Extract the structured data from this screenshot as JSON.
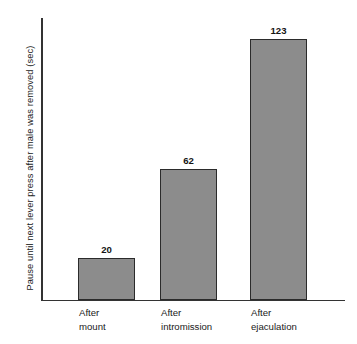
{
  "chart_data": {
    "type": "bar",
    "title": "",
    "subtitle": "",
    "xlabel": "",
    "ylabel": "Pause until next lever press after male was removed (sec)",
    "categories": [
      "After mount",
      "After intromission",
      "After ejaculation"
    ],
    "category_lines": [
      [
        "After",
        "mount"
      ],
      [
        "After",
        "intromission"
      ],
      [
        "After",
        "ejaculation"
      ]
    ],
    "values": [
      20,
      62,
      123
    ],
    "value_labels": [
      "20",
      "62",
      "123"
    ],
    "ylim": [
      0,
      133
    ],
    "grid": false,
    "legend": null,
    "y_ticks": [],
    "x_ticks": [],
    "annotations": [],
    "bar_fill_color": "#8c8c8c",
    "bar_border_color": "#2b2b2b",
    "axis_color": "#333333",
    "background_color": "#ffffff",
    "text_color": "#1a1a1a"
  }
}
